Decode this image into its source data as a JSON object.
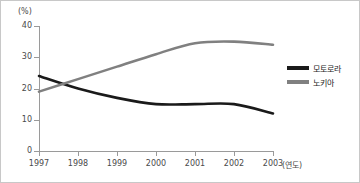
{
  "chart_data": {
    "type": "line",
    "title": "",
    "xlabel": "(연도)",
    "ylabel": "(%)",
    "x": [
      1997,
      1998,
      1999,
      2000,
      2001,
      2002,
      2003
    ],
    "categories": [
      "1997",
      "1998",
      "1999",
      "2000",
      "2001",
      "2002",
      "2003"
    ],
    "series": [
      {
        "name": "모토로라",
        "color": "#1a1a1a",
        "values": [
          24,
          20,
          17,
          15,
          15,
          15,
          12
        ]
      },
      {
        "name": "노키아",
        "color": "#808080",
        "values": [
          19,
          23,
          27,
          31,
          34.5,
          35,
          34
        ]
      }
    ],
    "ylim": [
      0,
      40
    ],
    "yticks": [
      0,
      10,
      20,
      30,
      40
    ],
    "ytick_labels": [
      "0",
      "10",
      "20",
      "30",
      "40"
    ],
    "grid": false,
    "legend_position": "right"
  },
  "axes": {
    "unit_label": "(%)",
    "x_axis_title": "(연도)",
    "y_ticks": [
      {
        "label": "40",
        "value": 40
      },
      {
        "label": "30",
        "value": 30
      },
      {
        "label": "20",
        "value": 20
      },
      {
        "label": "10",
        "value": 10
      },
      {
        "label": "0",
        "value": 0
      }
    ],
    "x_ticks": [
      {
        "label": "1997"
      },
      {
        "label": "1998"
      },
      {
        "label": "1999"
      },
      {
        "label": "2000"
      },
      {
        "label": "2001"
      },
      {
        "label": "2002"
      },
      {
        "label": "2003"
      }
    ]
  },
  "legend": {
    "items": [
      {
        "label": "모토로라",
        "color": "#1a1a1a"
      },
      {
        "label": "노키아",
        "color": "#808080"
      }
    ]
  },
  "colors": {
    "motorola": "#1a1a1a",
    "nokia": "#808080",
    "axis": "#9a9a9a",
    "text": "#4a4a4a",
    "border": "#c8c8c8",
    "background": "#ffffff"
  }
}
